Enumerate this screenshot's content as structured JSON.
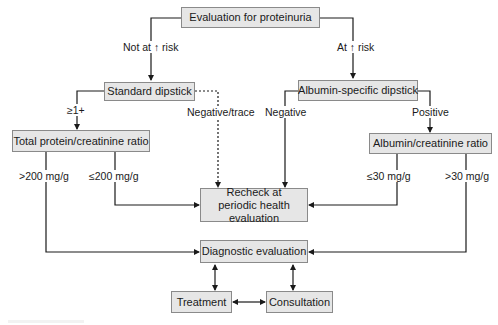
{
  "diagram": {
    "nodes": {
      "start": "Evaluation for proteinuria",
      "standard_dipstick": "Standard dipstick",
      "albumin_dipstick": "Albumin-specific dipstick",
      "total_protein_ratio": "Total protein/creatinine ratio",
      "albumin_ratio": "Albumin/creatinine ratio",
      "recheck": "Recheck at periodic health evaluation",
      "diagnostic": "Diagnostic evaluation",
      "treatment": "Treatment",
      "consultation": "Consultation"
    },
    "edge_labels": {
      "not_at_risk": "Not at ↑ risk",
      "at_risk": "At ↑ risk",
      "ge_1plus": "≥1+",
      "negative_trace": "Negative/trace",
      "negative": "Negative",
      "positive": "Positive",
      "gt_200": ">200 mg/g",
      "le_200": "≤200 mg/g",
      "le_30": "≤30 mg/g",
      "gt_30": ">30 mg/g"
    },
    "colors": {
      "box_fill": "#e6e6e6",
      "box_border": "#8a8a8a",
      "line": "#1a1a1a"
    }
  }
}
